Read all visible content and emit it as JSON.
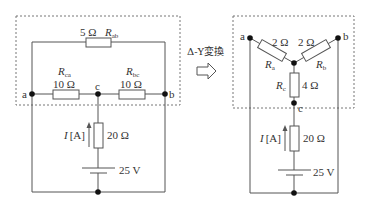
{
  "left_circuit": {
    "nodes": {
      "a": "a",
      "b": "b",
      "c": "c"
    },
    "r_ab": {
      "value": "5 Ω",
      "name": "R",
      "sub": "ab"
    },
    "r_ca": {
      "value": "10 Ω",
      "name": "R",
      "sub": "ca"
    },
    "r_bc": {
      "value": "10 Ω",
      "name": "R",
      "sub": "bc"
    },
    "r_series": {
      "value": "20 Ω"
    },
    "current": {
      "symbol": "I",
      "unit": "[A]"
    },
    "source": {
      "value": "25 V"
    }
  },
  "transform": {
    "label": "Δ-Y変換"
  },
  "right_circuit": {
    "nodes": {
      "a": "a",
      "b": "b",
      "c": "c"
    },
    "r_a": {
      "value": "2 Ω",
      "name": "R",
      "sub": "a"
    },
    "r_b": {
      "value": "2 Ω",
      "name": "R",
      "sub": "b"
    },
    "r_c": {
      "value": "4 Ω",
      "name": "R",
      "sub": "c"
    },
    "r_series": {
      "value": "20 Ω"
    },
    "current": {
      "symbol": "I",
      "unit": "[A]"
    },
    "source": {
      "value": "25 V"
    }
  }
}
